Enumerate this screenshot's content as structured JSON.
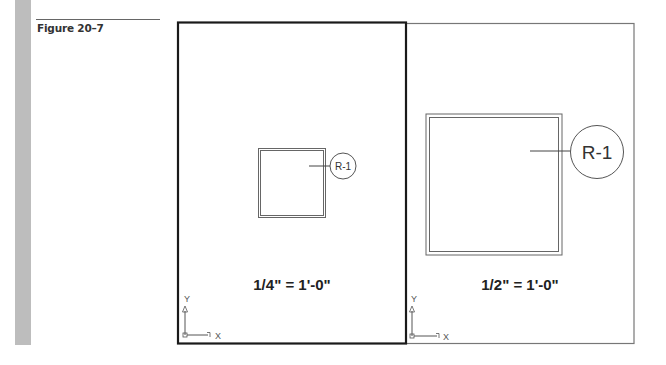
{
  "figure": {
    "label": "Figure 20–7"
  },
  "viewports": [
    {
      "name": "left-viewport",
      "scale_label": "1/4\" = 1'-0\"",
      "room_tag": "R-1",
      "active": true,
      "ucs": {
        "x_label": "X",
        "y_label": "Y"
      }
    },
    {
      "name": "right-viewport",
      "scale_label": "1/2\" = 1'-0\"",
      "room_tag": "R-1",
      "active": false,
      "ucs": {
        "x_label": "X",
        "y_label": "Y"
      }
    }
  ],
  "colors": {
    "sidebar_bar": "#bdbdbd",
    "active_border": "#1a1a1a",
    "inactive_border": "#777777"
  }
}
